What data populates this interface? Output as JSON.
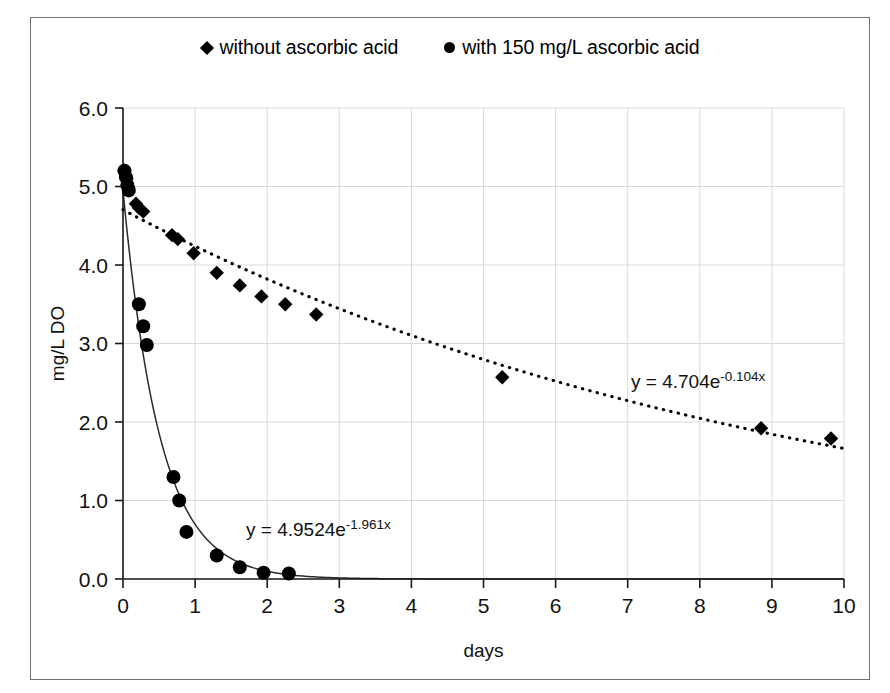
{
  "figure": {
    "y_axis_title": "mg/L DO",
    "x_axis_title": "days"
  },
  "legend": {
    "position": "top-center",
    "entries": [
      {
        "marker": "diamond-marker",
        "label": "without ascorbic acid"
      },
      {
        "marker": "circle-marker",
        "label": "with 150 mg/L ascorbic acid"
      }
    ]
  },
  "annotations": {
    "fit_without": {
      "base": "y = 4.704e",
      "exponent": "-0.104x",
      "full": "y = 4.704e-0.104x"
    },
    "fit_with": {
      "base": "y = 4.9524e",
      "exponent": "-1.961x",
      "full": "y = 4.9524e-1.961x"
    }
  },
  "chart_data": {
    "type": "scatter",
    "title": "",
    "xlabel": "days",
    "ylabel": "mg/L DO",
    "xlim": [
      0,
      10
    ],
    "ylim": [
      0,
      6
    ],
    "xticks": [
      0,
      1,
      2,
      3,
      4,
      5,
      6,
      7,
      8,
      9,
      10
    ],
    "yticks": [
      "0.0",
      "1.0",
      "2.0",
      "3.0",
      "4.0",
      "5.0",
      "6.0"
    ],
    "grid": true,
    "legend_position": "top-center",
    "series": [
      {
        "name": "without ascorbic acid",
        "marker": "diamond",
        "color": "#000000",
        "points": [
          [
            0.02,
            5.2
          ],
          [
            0.05,
            5.1
          ],
          [
            0.07,
            5.0
          ],
          [
            0.18,
            4.78
          ],
          [
            0.22,
            4.73
          ],
          [
            0.28,
            4.68
          ],
          [
            0.68,
            4.38
          ],
          [
            0.76,
            4.33
          ],
          [
            0.98,
            4.15
          ],
          [
            1.3,
            3.9
          ],
          [
            1.62,
            3.74
          ],
          [
            1.92,
            3.6
          ],
          [
            2.25,
            3.5
          ],
          [
            2.68,
            3.37
          ],
          [
            5.26,
            2.57
          ],
          [
            8.85,
            1.92
          ],
          [
            9.82,
            1.79
          ]
        ],
        "fit": {
          "equation": "y = 4.704e-0.104x",
          "a": 4.704,
          "b": -0.104,
          "style": "dotted"
        }
      },
      {
        "name": "with 150 mg/L ascorbic acid",
        "marker": "circle",
        "color": "#000000",
        "points": [
          [
            0.02,
            5.2
          ],
          [
            0.04,
            5.12
          ],
          [
            0.06,
            5.02
          ],
          [
            0.08,
            4.95
          ],
          [
            0.22,
            3.5
          ],
          [
            0.28,
            3.22
          ],
          [
            0.33,
            2.98
          ],
          [
            0.7,
            1.3
          ],
          [
            0.78,
            1.0
          ],
          [
            0.88,
            0.6
          ],
          [
            1.3,
            0.3
          ],
          [
            1.62,
            0.15
          ],
          [
            1.95,
            0.08
          ],
          [
            2.3,
            0.07
          ]
        ],
        "fit": {
          "equation": "y = 4.9524e-1.961x",
          "a": 4.9524,
          "b": -1.961,
          "style": "solid"
        }
      }
    ]
  }
}
